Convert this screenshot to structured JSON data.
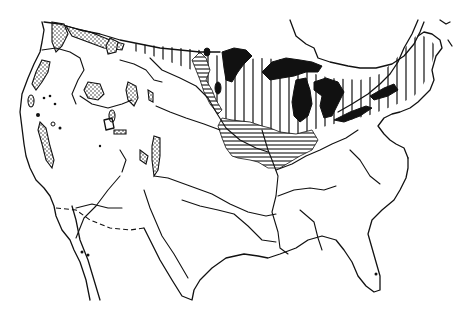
{
  "map": {
    "title": "",
    "subject": "United States outline map with hatched northern region and Great Lakes",
    "regions": [
      {
        "name": "vertical-hatched-region",
        "pattern": "vertical-lines",
        "extent": "northern plains to New England"
      },
      {
        "name": "horizontal-hatched-region",
        "pattern": "horizontal-lines",
        "extent": "Iowa-Illinois-Ohio valley"
      },
      {
        "name": "stippled-patches",
        "pattern": "dots",
        "extent": "Pacific Northwest and Rocky Mountains"
      },
      {
        "name": "great-lakes",
        "pattern": "solid-black"
      }
    ],
    "colors": {
      "ink": "#111111",
      "background": "#ffffff"
    },
    "labels": []
  }
}
